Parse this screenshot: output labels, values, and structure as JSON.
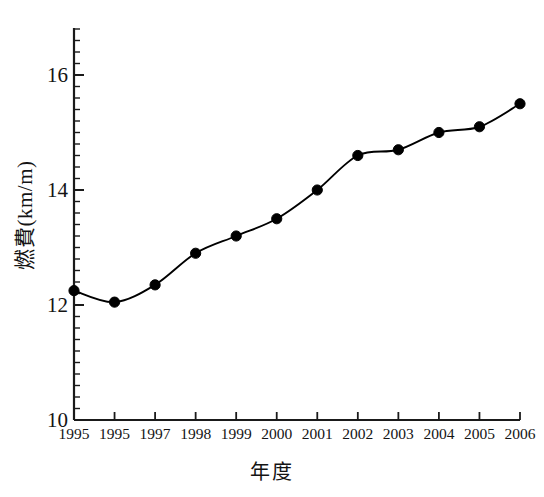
{
  "chart_data": {
    "type": "line",
    "title": "",
    "xlabel": "年度",
    "ylabel": "燃費(km/m)",
    "categories": [
      "1995",
      "1995",
      "1997",
      "1998",
      "1999",
      "2000",
      "2001",
      "2002",
      "2003",
      "2004",
      "2005",
      "2006"
    ],
    "values": [
      12.25,
      12.05,
      12.35,
      12.9,
      13.2,
      13.5,
      14.0,
      14.6,
      14.7,
      15.0,
      15.1,
      15.5
    ],
    "ylim": [
      10,
      16.85
    ],
    "y_major_ticks": [
      10,
      12,
      14,
      16
    ],
    "y_major_tick_labels": [
      "10",
      "12",
      "14",
      "16"
    ],
    "y_minor_tick_step": 0.2,
    "grid": "off",
    "legend": "none",
    "marker": "filled-circle",
    "line_color": "#000000",
    "marker_color": "#000000",
    "background_color": "#ffffff",
    "axis_color": "#1a1a1a"
  },
  "axes": {
    "y_title": "燃費(km/m)",
    "x_title": "年度"
  }
}
